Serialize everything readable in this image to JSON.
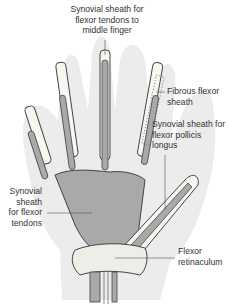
{
  "figure": {
    "colors": {
      "skin_outline": "#ececec",
      "bone": "#f7f7f2",
      "bone_stroke": "#444444",
      "sheath": "#a9a9a9",
      "retinaculum": "#eeeee8",
      "leader_line": "#555555"
    },
    "labels": {
      "middle_finger_sheath": [
        "Synovial sheath for",
        "flexor tendons to",
        "middle finger"
      ],
      "fibrous_flexor_sheath": [
        "Fibrous flexor",
        "sheath"
      ],
      "pollicis_longus_sheath": [
        "Synovial sheath for",
        "flexor pollicis",
        "longus"
      ],
      "flexor_tendons_sheath": [
        "Synovial",
        "sheath",
        "for flexor",
        "tendons"
      ],
      "flexor_retinaculum": [
        "Flexor",
        "retinaculum"
      ]
    }
  }
}
